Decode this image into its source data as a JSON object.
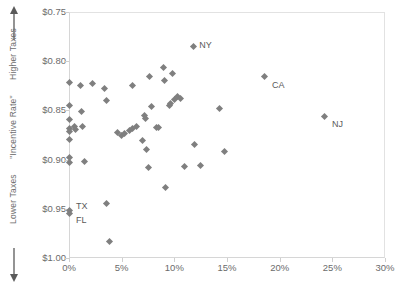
{
  "chart_data": {
    "type": "scatter",
    "title": "",
    "xlabel": "",
    "ylabel": "\"Incentive Rate\"",
    "axis_captions": {
      "y_top": "Higher Taxes",
      "y_mid": "\"Incentive Rate\"",
      "y_bottom": "Lower Taxes",
      "y_arrow_up": "up-arrow",
      "y_arrow_down": "down-arrow"
    },
    "xlim": [
      0,
      30
    ],
    "ylim": [
      0.75,
      1.0
    ],
    "y_inverted": true,
    "grid": false,
    "legend": "none",
    "xticks": [
      0,
      5,
      10,
      15,
      20,
      25,
      30
    ],
    "xtick_labels": [
      "0%",
      "5%",
      "10%",
      "15%",
      "20%",
      "25%",
      "30%"
    ],
    "yticks": [
      0.75,
      0.8,
      0.85,
      0.9,
      0.95,
      1.0
    ],
    "ytick_labels": [
      "$0.75",
      "$0.80",
      "$0.85",
      "$0.90",
      "$0.95",
      "$1.00"
    ],
    "marker": "diamond",
    "marker_color": "#7f7f7f",
    "points": [
      {
        "x": 11.8,
        "y": 0.785,
        "label": "NY"
      },
      {
        "x": 18.6,
        "y": 0.816,
        "label": "CA"
      },
      {
        "x": 24.3,
        "y": 0.856,
        "label": "NJ"
      },
      {
        "x": 0.0,
        "y": 0.952,
        "label": "TX"
      },
      {
        "x": 0.0,
        "y": 0.955,
        "label": "FL"
      },
      {
        "x": 0.0,
        "y": 0.822,
        "label": ""
      },
      {
        "x": 0.0,
        "y": 0.845,
        "label": ""
      },
      {
        "x": 0.0,
        "y": 0.859,
        "label": ""
      },
      {
        "x": 0.0,
        "y": 0.868,
        "label": ""
      },
      {
        "x": 0.0,
        "y": 0.871,
        "label": ""
      },
      {
        "x": 0.0,
        "y": 0.88,
        "label": ""
      },
      {
        "x": 0.0,
        "y": 0.898,
        "label": ""
      },
      {
        "x": 0.0,
        "y": 0.903,
        "label": ""
      },
      {
        "x": 0.5,
        "y": 0.866,
        "label": ""
      },
      {
        "x": 0.6,
        "y": 0.869,
        "label": ""
      },
      {
        "x": 1.1,
        "y": 0.825,
        "label": ""
      },
      {
        "x": 1.2,
        "y": 0.851,
        "label": ""
      },
      {
        "x": 1.3,
        "y": 0.866,
        "label": ""
      },
      {
        "x": 1.5,
        "y": 0.902,
        "label": ""
      },
      {
        "x": 2.2,
        "y": 0.823,
        "label": ""
      },
      {
        "x": 3.4,
        "y": 0.828,
        "label": ""
      },
      {
        "x": 3.6,
        "y": 0.84,
        "label": ""
      },
      {
        "x": 3.6,
        "y": 0.945,
        "label": ""
      },
      {
        "x": 3.8,
        "y": 0.983,
        "label": ""
      },
      {
        "x": 4.6,
        "y": 0.872,
        "label": ""
      },
      {
        "x": 5.0,
        "y": 0.875,
        "label": ""
      },
      {
        "x": 5.3,
        "y": 0.873,
        "label": ""
      },
      {
        "x": 5.7,
        "y": 0.87,
        "label": ""
      },
      {
        "x": 6.0,
        "y": 0.868,
        "label": ""
      },
      {
        "x": 6.0,
        "y": 0.825,
        "label": ""
      },
      {
        "x": 6.4,
        "y": 0.866,
        "label": ""
      },
      {
        "x": 7.0,
        "y": 0.881,
        "label": ""
      },
      {
        "x": 7.2,
        "y": 0.855,
        "label": ""
      },
      {
        "x": 7.3,
        "y": 0.858,
        "label": ""
      },
      {
        "x": 7.4,
        "y": 0.89,
        "label": ""
      },
      {
        "x": 7.5,
        "y": 0.908,
        "label": ""
      },
      {
        "x": 7.6,
        "y": 0.816,
        "label": ""
      },
      {
        "x": 7.8,
        "y": 0.846,
        "label": ""
      },
      {
        "x": 8.3,
        "y": 0.867,
        "label": ""
      },
      {
        "x": 8.5,
        "y": 0.867,
        "label": ""
      },
      {
        "x": 9.0,
        "y": 0.806,
        "label": ""
      },
      {
        "x": 9.1,
        "y": 0.82,
        "label": ""
      },
      {
        "x": 9.2,
        "y": 0.928,
        "label": ""
      },
      {
        "x": 9.5,
        "y": 0.845,
        "label": ""
      },
      {
        "x": 9.6,
        "y": 0.843,
        "label": ""
      },
      {
        "x": 9.8,
        "y": 0.813,
        "label": ""
      },
      {
        "x": 10.0,
        "y": 0.839,
        "label": ""
      },
      {
        "x": 10.3,
        "y": 0.836,
        "label": ""
      },
      {
        "x": 10.6,
        "y": 0.838,
        "label": ""
      },
      {
        "x": 11.0,
        "y": 0.907,
        "label": ""
      },
      {
        "x": 11.9,
        "y": 0.885,
        "label": ""
      },
      {
        "x": 12.5,
        "y": 0.906,
        "label": ""
      },
      {
        "x": 14.3,
        "y": 0.848,
        "label": ""
      },
      {
        "x": 14.8,
        "y": 0.892,
        "label": ""
      }
    ]
  }
}
